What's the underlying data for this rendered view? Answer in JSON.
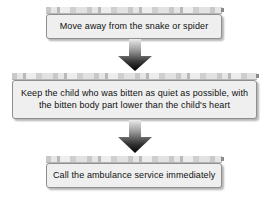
{
  "diagram": {
    "type": "vertical-flowchart",
    "background_color": "#ffffff",
    "box_fill_color": "#efefef",
    "box_border_color": "#8f8f8f",
    "arrow_gradient_from": "#e8e8e8",
    "arrow_gradient_to": "#000000",
    "steps": [
      {
        "id": "step-1",
        "lines": [
          "Move away from the snake or spider"
        ]
      },
      {
        "id": "step-2",
        "lines": [
          "Keep the child who was bitten as quiet as possible, with",
          "the bitten body part lower than the child's heart"
        ]
      },
      {
        "id": "step-3",
        "lines": [
          "Call the ambulance service immediately"
        ]
      }
    ],
    "connectors": [
      {
        "id": "arrow-1",
        "icon": "down-arrow-icon",
        "from": "step-1",
        "to": "step-2"
      },
      {
        "id": "arrow-2",
        "icon": "down-arrow-icon",
        "from": "step-2",
        "to": "step-3"
      }
    ]
  }
}
